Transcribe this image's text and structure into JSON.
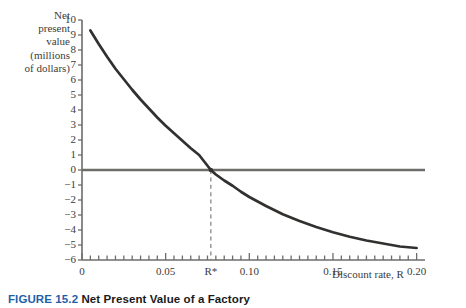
{
  "figure": {
    "caption_number": "FIGURE 15.2",
    "caption_text": "Net Present Value of a Factory"
  },
  "axes": {
    "y_title": "Net\npresent\nvalue\n(millions\nof dollars)",
    "x_title": "Discount rate, R",
    "y_tick_labels": [
      "10",
      "9",
      "8",
      "7",
      "6",
      "5",
      "4",
      "3",
      "2",
      "1",
      "0",
      "−1",
      "−2",
      "−3",
      "−4",
      "−5",
      "−6"
    ],
    "x_tick_labels": [
      "0",
      "0.05",
      "R*",
      "0.10",
      "0.15",
      "0.20"
    ]
  },
  "annotations": {
    "rstar_label": "R*",
    "rstar_value": 0.077
  },
  "colors": {
    "curve": "#33312f",
    "axis": "#6e6c6a",
    "zero_line": "#6e6c6a",
    "dashed_line": "#8a8886",
    "text": "#3c3c3c",
    "caption_accent": "#1f5fa8",
    "background": "#ffffff"
  },
  "chart_data": {
    "type": "line",
    "title": "Net Present Value of a Factory",
    "xlabel": "Discount rate, R",
    "ylabel": "Net present value (millions of dollars)",
    "xlim": [
      0.0,
      0.205
    ],
    "ylim": [
      -6,
      10
    ],
    "grid": false,
    "legend": null,
    "x_major_ticks": [
      0.0,
      0.05,
      0.1,
      0.15,
      0.2
    ],
    "x_minor_tick_step": 0.005,
    "y_ticks": [
      -6,
      -5,
      -4,
      -3,
      -2,
      -1,
      0,
      1,
      2,
      3,
      4,
      5,
      6,
      7,
      8,
      9,
      10
    ],
    "zero_line_y": 0,
    "annotation_vline_x": 0.077,
    "annotation_vline_label": "R*",
    "series": [
      {
        "name": "Net present value",
        "x": [
          0.005,
          0.01,
          0.015,
          0.02,
          0.025,
          0.03,
          0.035,
          0.04,
          0.045,
          0.05,
          0.055,
          0.06,
          0.065,
          0.07,
          0.077,
          0.08,
          0.085,
          0.09,
          0.095,
          0.1,
          0.11,
          0.12,
          0.13,
          0.14,
          0.15,
          0.16,
          0.17,
          0.18,
          0.19,
          0.2
        ],
        "y": [
          9.3,
          8.4,
          7.55,
          6.75,
          6.05,
          5.35,
          4.7,
          4.1,
          3.5,
          2.95,
          2.45,
          1.95,
          1.45,
          1.0,
          0.0,
          -0.3,
          -0.7,
          -1.05,
          -1.45,
          -1.8,
          -2.4,
          -2.95,
          -3.4,
          -3.8,
          -4.15,
          -4.45,
          -4.7,
          -4.9,
          -5.1,
          -5.2
        ]
      }
    ]
  }
}
